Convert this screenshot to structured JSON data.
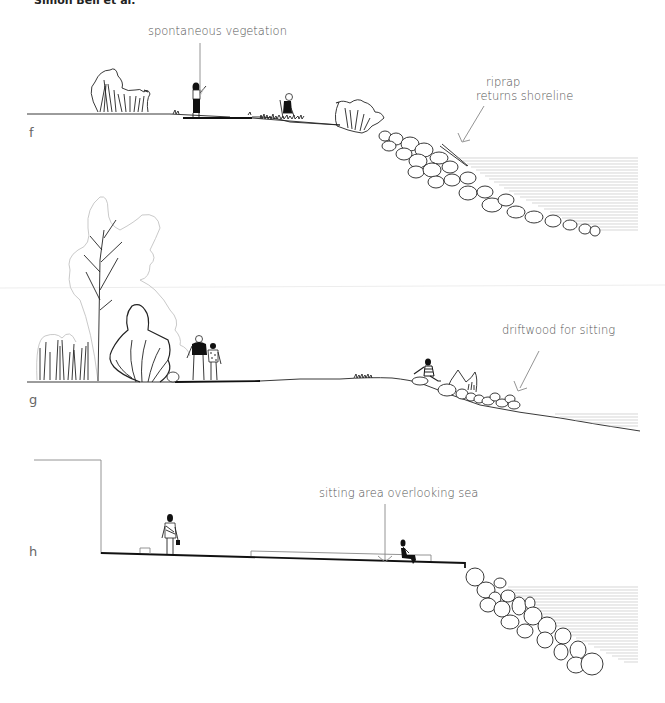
{
  "header": {
    "author": "Simon Bell et al."
  },
  "sections": [
    {
      "id": "f",
      "label": "f",
      "annotations": [
        {
          "text": "spontaneous vegetation"
        },
        {
          "text": "riprap"
        },
        {
          "text": "returns shoreline"
        }
      ]
    },
    {
      "id": "g",
      "label": "g",
      "annotations": [
        {
          "text": "driftwood for sitting"
        }
      ]
    },
    {
      "id": "h",
      "label": "h",
      "annotations": [
        {
          "text": "sitting area overlooking sea"
        }
      ]
    }
  ]
}
